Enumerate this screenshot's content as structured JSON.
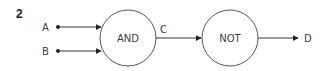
{
  "figure": {
    "number": "2"
  },
  "inputs": [
    {
      "label": "A"
    },
    {
      "label": "B"
    }
  ],
  "gates": [
    {
      "label": "AND"
    },
    {
      "label": "NOT"
    }
  ],
  "intermediate": {
    "label": "C"
  },
  "output": {
    "label": "D"
  },
  "colors": {
    "line": "#333333",
    "text": "#3a3a3a"
  }
}
